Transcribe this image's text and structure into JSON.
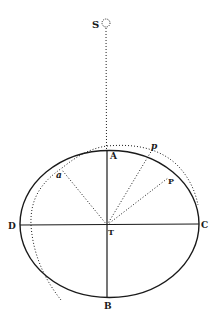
{
  "figure": {
    "type": "geometric diagram",
    "labels": {
      "S": "S",
      "A": "A",
      "B": "B",
      "C": "C",
      "D": "D",
      "T": "T",
      "P": "P",
      "p": "p",
      "a": "a"
    },
    "colors": {
      "ink": "#1a1a1a",
      "background": "#ffffff"
    }
  }
}
